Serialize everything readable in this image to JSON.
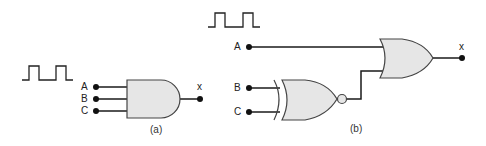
{
  "diagram_a": {
    "caption": "(a)",
    "inputs": [
      "A",
      "B",
      "C"
    ],
    "output": "x",
    "gate": "AND",
    "signal": "square-wave"
  },
  "diagram_b": {
    "caption": "(b)",
    "inputs": [
      "A",
      "B",
      "C"
    ],
    "output": "x",
    "gates": [
      "XNOR",
      "OR"
    ],
    "signal": "square-wave"
  },
  "colors": {
    "gate_fill": "#e6e6e6",
    "line": "#1a1a1a"
  }
}
